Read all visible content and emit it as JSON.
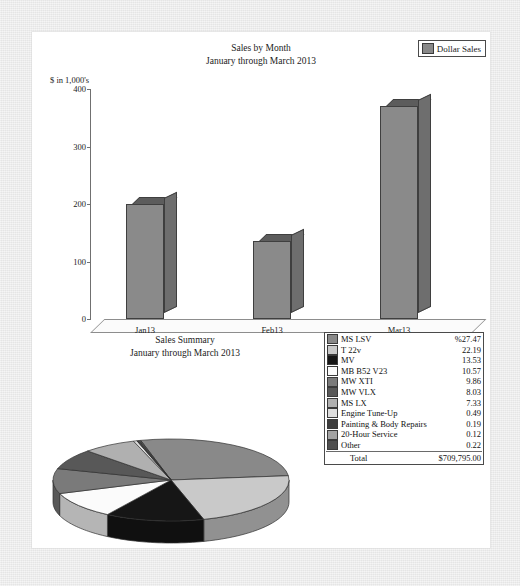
{
  "bar_chart": {
    "title_line1": "Sales by Month",
    "title_line2": "January through March 2013",
    "y_caption": "$ in 1,000's",
    "legend_label": "Dollar Sales",
    "legend_swatch_color": "#888888",
    "y_ticks": [
      "0",
      "100",
      "200",
      "300",
      "400"
    ],
    "x_labels": [
      "Jan13",
      "Feb13",
      "Mar13"
    ]
  },
  "summary": {
    "title_line1": "Sales Summary",
    "title_line2": "January through March 2013",
    "total_label": "Total",
    "total_value": "$709,795.00",
    "rows": [
      {
        "label": "MS LSV",
        "value": "%27.47",
        "color": "#898989"
      },
      {
        "label": "T 22v",
        "value": "22.19",
        "color": "#c9c9c9"
      },
      {
        "label": "MV",
        "value": "13.53",
        "color": "#161616"
      },
      {
        "label": "MB B52 V23",
        "value": "10.57",
        "color": "#fbfbfb"
      },
      {
        "label": "MW XTI",
        "value": "9.86",
        "color": "#7a7a7a"
      },
      {
        "label": "MW VLX",
        "value": "8.03",
        "color": "#585858"
      },
      {
        "label": "MS LX",
        "value": "7.33",
        "color": "#b0b0b0"
      },
      {
        "label": "Engine Tune-Up",
        "value": "0.49",
        "color": "#dedede"
      },
      {
        "label": "Painting & Body Repairs",
        "value": "0.19",
        "color": "#3d3d3d"
      },
      {
        "label": "20-Hour Service",
        "value": "0.12",
        "color": "#a3a3a3"
      },
      {
        "label": "Other",
        "value": "0.22",
        "color": "#4f4f4f"
      }
    ]
  },
  "chart_data": [
    {
      "type": "bar",
      "title": "Sales by Month — January through March 2013",
      "xlabel": "",
      "ylabel": "$ in 1,000's",
      "categories": [
        "Jan13",
        "Feb13",
        "Mar13"
      ],
      "values": [
        200,
        135,
        370
      ],
      "ylim": [
        0,
        400
      ],
      "yticks": [
        0,
        100,
        200,
        300,
        400
      ],
      "grid": false,
      "legend": [
        "Dollar Sales"
      ],
      "legend_position": "top-right",
      "series": [
        {
          "name": "Dollar Sales",
          "values": [
            200,
            135,
            370
          ]
        }
      ]
    },
    {
      "type": "pie",
      "title": "Sales Summary — January through March 2013",
      "total": "$709,795.00",
      "unit": "percent",
      "legend_position": "right",
      "labels": [
        "MS LSV",
        "T 22v",
        "MV",
        "MB B52 V23",
        "MW XTI",
        "MW VLX",
        "MS LX",
        "Engine Tune-Up",
        "Painting & Body Repairs",
        "20-Hour Service",
        "Other"
      ],
      "values": [
        27.47,
        22.19,
        13.53,
        10.57,
        9.86,
        8.03,
        7.33,
        0.49,
        0.19,
        0.12,
        0.22
      ],
      "colors": [
        "#898989",
        "#c9c9c9",
        "#161616",
        "#fbfbfb",
        "#7a7a7a",
        "#585858",
        "#b0b0b0",
        "#dedede",
        "#3d3d3d",
        "#a3a3a3",
        "#4f4f4f"
      ]
    }
  ]
}
